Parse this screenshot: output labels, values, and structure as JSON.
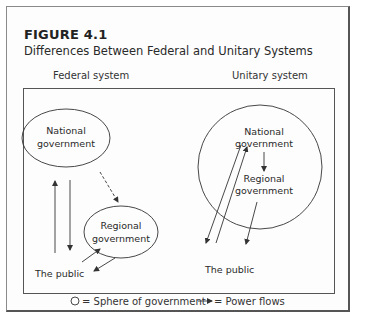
{
  "figure": {
    "number": "FIGURE 4.1",
    "title": "Differences Between Federal and Unitary Systems"
  },
  "panels": {
    "federal": {
      "heading": "Federal system",
      "national_line1": "National",
      "national_line2": "government",
      "regional_line1": "Regional",
      "regional_line2": "government",
      "public": "The public"
    },
    "unitary": {
      "heading": "Unitary system",
      "national_line1": "National",
      "national_line2": "government",
      "regional_line1": "Regional",
      "regional_line2": "government",
      "public": "The public"
    }
  },
  "legend": {
    "sphere_label": "= Sphere of government",
    "flow_label": "= Power flows"
  },
  "colors": {
    "line": "#333333",
    "text": "#2a2a2a",
    "background": "#ffffff"
  }
}
